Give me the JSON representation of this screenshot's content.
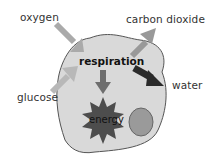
{
  "diagram": {
    "center_label": "respiration",
    "inputs": [
      {
        "label": "oxygen"
      },
      {
        "label": "glucose"
      }
    ],
    "outputs": [
      {
        "label": "carbon dioxide"
      },
      {
        "label": "water"
      },
      {
        "label": "energy"
      }
    ]
  },
  "colors": {
    "cell_fill": "#d9d9d9",
    "cell_stroke": "#555555",
    "input_arrow": "#aaaaaa",
    "co2_arrow": "#999999",
    "water_arrow": "#2a2a2a",
    "energy_arrow": "#6e6e6e",
    "energy_star": "#4d4d4d",
    "nucleus_fill": "#9a9a9a"
  }
}
